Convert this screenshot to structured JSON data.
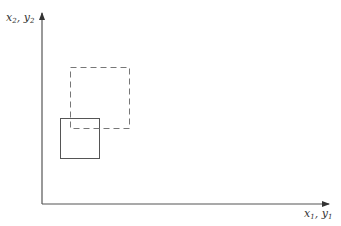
{
  "diagram": {
    "y_axis_label": {
      "var1": "x",
      "sub1": "2",
      "sep": ", ",
      "var2": "y",
      "sub2": "2"
    },
    "x_axis_label": {
      "var1": "x",
      "sub1": "1",
      "sep": ", ",
      "var2": "y",
      "sub2": "1"
    },
    "shapes": [
      {
        "name": "solid-rectangle",
        "style": "solid",
        "x": 60,
        "y": 118,
        "w": 39,
        "h": 40
      },
      {
        "name": "dashed-rectangle",
        "style": "dashed",
        "x": 70,
        "y": 67,
        "w": 59,
        "h": 61
      }
    ],
    "colors": {
      "axis": "#555555",
      "solid": "#555555",
      "dashed": "#777777"
    }
  }
}
